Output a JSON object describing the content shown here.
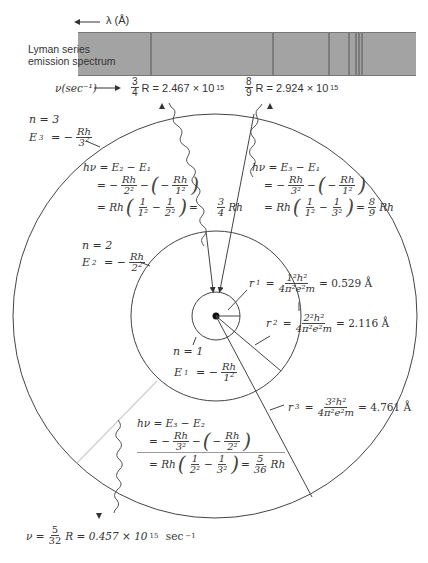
{
  "spectrum": {
    "wavelength_axis_label": "λ (Å)",
    "series_label_line1": "Lyman series",
    "series_label_line2": "emission spectrum",
    "frequency_axis_label": "ν(sec⁻¹)",
    "band_color": "#9a9a9a",
    "line_color": "#555555",
    "line_positions_x": [
      151,
      273,
      329,
      349,
      356,
      359,
      362
    ],
    "line_3_4": {
      "frac_num": "3",
      "frac_den": "4",
      "text": "R = 2.467 × 10",
      "exp": "15"
    },
    "line_8_9": {
      "frac_num": "8",
      "frac_den": "9",
      "text": "R = 2.924 × 10",
      "exp": "15"
    }
  },
  "levels": {
    "n3": {
      "n_label": "n = 3",
      "E_label": "E",
      "E_sub": "3",
      "E_eq": "= −",
      "num": "Rh",
      "den": "3",
      "den_exp": "2"
    },
    "n2": {
      "n_label": "n = 2",
      "E_label": "E",
      "E_sub": "2",
      "E_eq": "= −",
      "num": "Rh",
      "den": "2",
      "den_exp": "2"
    },
    "n1": {
      "n_label": "n = 1",
      "E_label": "E",
      "E_sub": "1",
      "E_eq": "= −",
      "num": "Rh",
      "den": "1",
      "den_exp": "2"
    }
  },
  "transitions": {
    "t21": {
      "line1": "hν = E₂ − E₁",
      "line2_a": "= −",
      "line2_num1": "Rh",
      "line2_den1": "2²",
      "line2_b": "−",
      "line2_num2": "Rh",
      "line2_den2": "1²",
      "line3_a": "= Rh",
      "line3_num1": "1",
      "line3_den1": "1²",
      "line3_b": "−",
      "line3_num2": "1",
      "line3_den2": "2²",
      "line3_c": "=",
      "result_num": "3",
      "result_den": "4",
      "result_text": "Rh"
    },
    "t31": {
      "line1": "hν = E₃ − E₁",
      "line2_a": "= −",
      "line2_num1": "Rh",
      "line2_den1": "3²",
      "line2_b": "−",
      "line2_num2": "Rh",
      "line2_den2": "1²",
      "line3_a": "= Rh",
      "line3_num1": "1",
      "line3_den1": "1²",
      "line3_b": "−",
      "line3_num2": "1",
      "line3_den2": "3²",
      "line3_c": "=",
      "result_num": "8",
      "result_den": "9",
      "result_text": "Rh"
    },
    "t32": {
      "line1": "hν = E₃ − E₂",
      "line2_a": "= −",
      "line2_num1": "Rh",
      "line2_den1": "3²",
      "line2_b": "−",
      "line2_num2": "Rh",
      "line2_den2": "2²",
      "line3_a": "= Rh",
      "line3_num1": "1",
      "line3_den1": "2²",
      "line3_b": "−",
      "line3_num2": "1",
      "line3_den2": "3²",
      "line3_c": "=",
      "result_num": "5",
      "result_den": "36",
      "result_text": "Rh"
    }
  },
  "radii": {
    "r1": {
      "label": "r",
      "sub": "1",
      "num": "1²h²",
      "den": "4π²e²m",
      "value": "= 0.529 Å"
    },
    "r2": {
      "label": "r",
      "sub": "2",
      "num": "2²h²",
      "den": "4π²e²m",
      "value": "= 2.116 Å"
    },
    "r3": {
      "label": "r",
      "sub": "3",
      "num": "3²h²",
      "den": "4π²e²m",
      "value": "= 4.761 Å"
    }
  },
  "balmer_emission": {
    "prefix": "ν =",
    "frac_num": "5",
    "frac_den": "32",
    "text": "R = 0.457 × 10",
    "exp": "15",
    "unit": "sec",
    "unit_exp": "−1"
  },
  "geometry": {
    "nucleus": {
      "x": 216,
      "y": 316
    },
    "orbit_radii": {
      "n1": 24,
      "n2": 85,
      "n3": 202
    }
  }
}
